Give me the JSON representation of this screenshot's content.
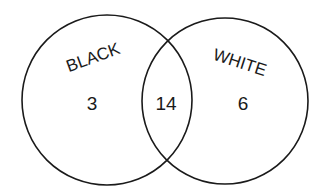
{
  "diagram": {
    "type": "venn",
    "sets": [
      {
        "name": "BLACK",
        "only_count": "3"
      },
      {
        "name": "WHITE",
        "only_count": "6"
      }
    ],
    "intersection_count": "14",
    "colors": {
      "stroke": "#1a1a1a",
      "background": "#ffffff"
    }
  }
}
